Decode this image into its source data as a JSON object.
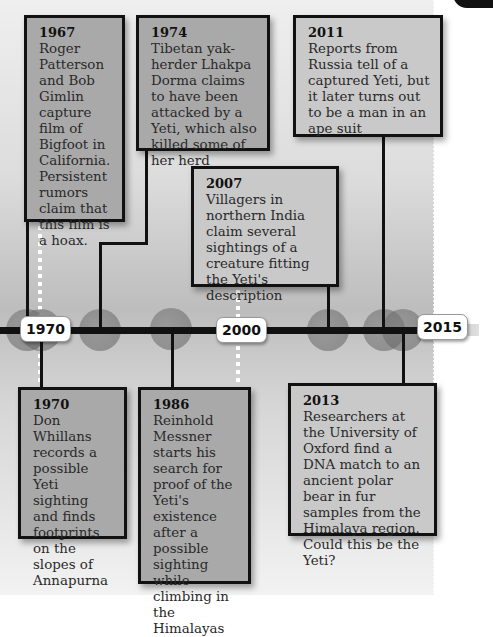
{
  "axis": {
    "labels": [
      {
        "text": "1970"
      },
      {
        "text": "2000"
      },
      {
        "text": "2015"
      }
    ]
  },
  "events": [
    {
      "year": "1967",
      "text": "Roger Patterson and Bob Gimlin capture film of Bigfoot in California. Persistent rumors claim that this film is a hoax.",
      "position": "above"
    },
    {
      "year": "1974",
      "text": "Tibetan yak-herder Lhakpa Dorma claims to have been attacked by a Yeti, which also killed some of her herd",
      "position": "above"
    },
    {
      "year": "2007",
      "text": "Villagers in northern India claim several sightings of a creature fitting the Yeti's description",
      "position": "above"
    },
    {
      "year": "2011",
      "text": "Reports from Russia tell of a captured Yeti, but it later turns out to be a man in an ape suit",
      "position": "above"
    },
    {
      "year": "1970",
      "text": "Don Whillans records a possible Yeti sighting and finds footprints on the slopes of Annapurna",
      "position": "below"
    },
    {
      "year": "1986",
      "text": "Reinhold Messner starts his search for proof of the Yeti's existence after a possible sighting while climbing in the Himalayas",
      "position": "below"
    },
    {
      "year": "2013",
      "text": "Researchers at the University of Oxford find a DNA match to an ancient polar bear in fur samples from the Himalaya region. Could this be the Yeti?",
      "position": "below"
    }
  ],
  "colors": {
    "box_dark": "#a9a9a9",
    "box_mid": "#bdbdbd",
    "box_light": "#c9c9c9",
    "line": "#111111",
    "label_bg": "#ffffff"
  }
}
